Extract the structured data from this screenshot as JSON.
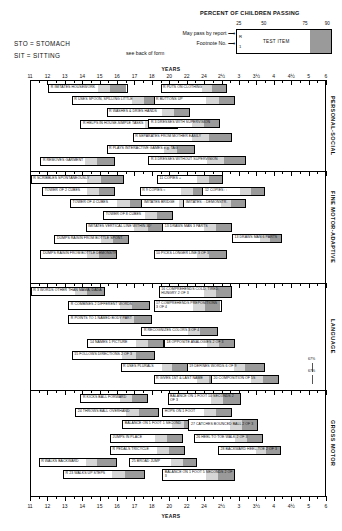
{
  "header": {
    "percent_title": "PERCENT OF CHILDREN PASSING",
    "percentiles": [
      "25",
      "50",
      "75",
      "90"
    ],
    "legend": {
      "test_item": "TEST ITEM",
      "r_mark": "R",
      "footnote_mark": "1"
    },
    "notes": {
      "may_pass": "May pass by report",
      "arrow": "⟶",
      "footnote": "Footnote No.",
      "see_back": "see back of form"
    },
    "abbreviations": {
      "sto": "STO = STOMACH",
      "sit": "SIT = SITTING"
    }
  },
  "axis": {
    "unit_label": "YEARS",
    "ticks": [
      "11",
      "12",
      "13",
      "14",
      "15",
      "16",
      "17",
      "18",
      "20",
      "22",
      "24",
      "2½",
      "3",
      "3½",
      "4",
      "4½",
      "5",
      "6"
    ]
  },
  "sections": [
    {
      "name": "PERSONAL-SOCIAL"
    },
    {
      "name": "FINE MOTOR-ADAPTIVE"
    },
    {
      "name": "LANGUAGE"
    },
    {
      "name": "GROSS MOTOR"
    }
  ],
  "items": {
    "personal_social": [
      {
        "label": "IMITATES HOUSEWORK",
        "r": "R"
      },
      {
        "label": "PUTS ON CLOTHING",
        "r": "R"
      },
      {
        "label": "USES SPOON, SPILLING LITTLE",
        "r": "R"
      },
      {
        "label": "BUTTONS UP",
        "r": "R"
      },
      {
        "label": "WASHES & DRIES HANDS",
        "r": "R"
      },
      {
        "label": "HELPS IN HOUSE-SIMPLE TASKS",
        "r": "R"
      },
      {
        "label": "DRESSES WITH SUPERVISION",
        "r": "R",
        "fn": "3"
      },
      {
        "label": "SEPARATES FROM MOTHER EASILY",
        "r": "R"
      },
      {
        "label": "PLAYS INTERACTIVE GAMES e.g. TAG",
        "r": "R"
      },
      {
        "label": "REMOVES GARMENT",
        "r": "R"
      },
      {
        "label": "DRESSES WITHOUT SUPERVISION",
        "r": "R",
        "fn": "3"
      }
    ],
    "fine_motor": [
      {
        "label": "SCRIBBLES SPONTANEOUSLY",
        "r": "R"
      },
      {
        "label": "COPIES +",
        "fn": "11"
      },
      {
        "label": "TOWER OF 2 CUBES"
      },
      {
        "label": "COPIES ○",
        "r": "R",
        "fn": "9"
      },
      {
        "label": "COPIES □",
        "fn": "12"
      },
      {
        "label": "TOWER OF 4 CUBES"
      },
      {
        "label": "IMITATES BRIDGE"
      },
      {
        "label": "IMITATES □ DEMONSTR."
      },
      {
        "label": "TOWER OF 8 CUBES"
      },
      {
        "label": "IMITATES VERTICAL LINE WITHIN 30°"
      },
      {
        "label": "DRAWS MAN 3 PARTS",
        "fn": "13"
      },
      {
        "label": "DUMPS RAISIN FROM BOTTLE SPONT."
      },
      {
        "label": "DRAWS MAN 6 PARTS",
        "fn": "13"
      },
      {
        "label": "DUMPS RAISIN FROM BOTTLE DEMONSTR."
      },
      {
        "label": "PICKS LONGER LINE 3 OF 3",
        "fn": "10"
      }
    ],
    "language": [
      {
        "label": "3 WORDS OTHER THAN MAMA, DADA",
        "r": "R"
      },
      {
        "label": "COMPREHENDS COLD, TIRED, HUNGRY 2 OF 3",
        "fn": "16",
        "two": true
      },
      {
        "label": "COMBINES 2 DIFFERENT WORDS",
        "r": "R"
      },
      {
        "label": "COMPREHENDS PREPOSITIONS 3 OF 4",
        "fn": "17",
        "two": true
      },
      {
        "label": "POINTS TO 1 NAMED BODY PART",
        "r": "R"
      },
      {
        "label": "RECOGNIZES COLORS 3 OF 4",
        "r": "R"
      },
      {
        "label": "NAMES 1 PICTURE",
        "fn": "14"
      },
      {
        "label": "OPPOSITE ANALOGIES 2 OF 3",
        "fn": "18"
      },
      {
        "label": "FOLLOWS DIRECTIONS 2 OF 3",
        "fn": "15"
      },
      {
        "label": "USES PLURALS",
        "r": "R"
      },
      {
        "label": "DEFINES WORDS 6 OF 9",
        "fn": "19"
      },
      {
        "label": "GIVES 1ST & LAST NAME",
        "r": "R"
      },
      {
        "label": "COMPOSITION OF 5S",
        "fn": "20"
      }
    ],
    "gross_motor": [
      {
        "label": "KICKS BALL FORWARD",
        "r": "R"
      },
      {
        "label": "BALANCE ON 1 FOOT 10 SECONDS 2 OF 3",
        "two": true
      },
      {
        "label": "THROWS BALL OVERHAND",
        "fn": "24"
      },
      {
        "label": "HOPS ON 1 FOOT"
      },
      {
        "label": "BALANCE ON 1 FOOT 1 SECOND"
      },
      {
        "label": "CATCHES BOUNCED BALL 2 OF 3",
        "fn": "27",
        "two": true
      },
      {
        "label": "JUMPS IN PLACE"
      },
      {
        "label": "HEEL TO TOE WALK 2 OF 3",
        "fn": "26"
      },
      {
        "label": "PEDALS TRICYCLE",
        "r": "R"
      },
      {
        "label": "BACKWARD HEEL-TOE 2 OF 3",
        "fn": "28"
      },
      {
        "label": "WALKS BACKWARD",
        "r": "R"
      },
      {
        "label": "BROAD JUMP",
        "fn": "25"
      },
      {
        "label": "WALKS UP STEPS",
        "r": "R",
        "fn": "23"
      },
      {
        "label": "BALANCE ON 1 FOOT 5 SECONDS 2 OF 3",
        "two": true
      }
    ]
  },
  "pct_notes": [
    "67%",
    "67%"
  ],
  "chart_data": {
    "type": "bar",
    "xlabel": "YEARS",
    "xticks": [
      "11",
      "12",
      "13",
      "14",
      "15",
      "16",
      "17",
      "18",
      "20",
      "22",
      "24",
      "2½",
      "3",
      "3½",
      "4",
      "4½",
      "5",
      "6"
    ],
    "percentile_legend": [
      25,
      50,
      75,
      90
    ],
    "note": "Each bar spans the ages at which 25%, 50%, 75% and 90% of children pass the item."
  }
}
